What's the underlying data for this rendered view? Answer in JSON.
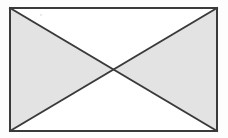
{
  "figure": {
    "name": "rectangle-with-crossed-diagonals",
    "description": "Rectangle outlined in dark gray containing two full diagonals forming an X, dividing the interior into four triangles",
    "background_color": "#fdfdfd",
    "canvas": {
      "width": 228,
      "height": 138
    },
    "rectangle": {
      "x": 10,
      "y": 8,
      "width": 207,
      "height": 123,
      "stroke_color": "#3a3a3a",
      "stroke_width": 2,
      "fill_color": "#ffffff",
      "corners": {
        "top_left": [
          10,
          8
        ],
        "top_right": [
          217,
          8
        ],
        "bottom_right": [
          217,
          131
        ],
        "bottom_left": [
          10,
          131
        ]
      }
    },
    "center_point": {
      "x": 113.5,
      "y": 69.5
    },
    "diagonals": [
      {
        "label": "diagonal-top-left-to-bottom-right",
        "from": [
          10,
          8
        ],
        "to": [
          217,
          131
        ],
        "stroke_color": "#3a3a3a",
        "stroke_width": 2
      },
      {
        "label": "diagonal-bottom-left-to-top-right",
        "from": [
          10,
          131
        ],
        "to": [
          217,
          8
        ],
        "stroke_color": "#3a3a3a",
        "stroke_width": 2
      }
    ],
    "triangles": [
      {
        "label": "top-triangle",
        "points": "10,8 217,8 113.5,69.5",
        "fill_color": "#ffffff",
        "shaded": "no"
      },
      {
        "label": "right-triangle",
        "points": "217,8 217,131 113.5,69.5",
        "fill_color": "#e3e3e3",
        "shaded": "yes"
      },
      {
        "label": "bottom-triangle",
        "points": "10,131 217,131 113.5,69.5",
        "fill_color": "#ffffff",
        "shaded": "no"
      },
      {
        "label": "left-triangle",
        "points": "10,8 10,131 113.5,69.5",
        "fill_color": "#e3e3e3",
        "shaded": "yes"
      }
    ],
    "artifacts": [
      {
        "label": "scan-speck",
        "x": 40,
        "y": 14,
        "color": "#d8d8d8"
      }
    ],
    "text_labels": []
  }
}
